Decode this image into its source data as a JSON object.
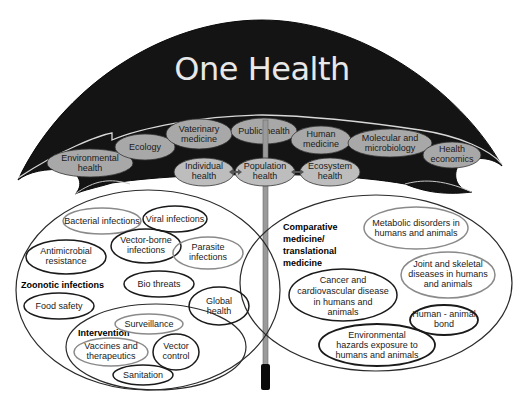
{
  "title": "One Health",
  "canopy": {
    "top_row": [
      {
        "id": "environmental-health",
        "lines": [
          "Environmental",
          "health"
        ]
      },
      {
        "id": "ecology",
        "lines": [
          "Ecology"
        ]
      },
      {
        "id": "veterinary-medicine",
        "lines": [
          "Vaterinary",
          "medicine"
        ]
      },
      {
        "id": "public-health",
        "lines": [
          "Public health"
        ]
      },
      {
        "id": "human-medicine",
        "lines": [
          "Human",
          "medicine"
        ]
      },
      {
        "id": "molecular-microbiology",
        "lines": [
          "Molecular and",
          "microbiology"
        ]
      },
      {
        "id": "health-economics",
        "lines": [
          "Health",
          "economics"
        ]
      }
    ],
    "bottom_row": [
      {
        "id": "individual-health",
        "lines": [
          "Individual",
          "health"
        ]
      },
      {
        "id": "population-health",
        "lines": [
          "Population",
          "health"
        ]
      },
      {
        "id": "ecosystem-health",
        "lines": [
          "Ecosystem",
          "health"
        ]
      }
    ],
    "connectors": "double-headed arrows"
  },
  "left_circle": {
    "label": "Zoonotic infections",
    "items": [
      {
        "id": "bacterial-infections",
        "lines": [
          "Bacterial infections"
        ],
        "border": "#8a8a8a"
      },
      {
        "id": "viral-infections",
        "lines": [
          "Viral infections"
        ],
        "border": "#1a1a1a"
      },
      {
        "id": "vector-borne-infections",
        "lines": [
          "Vector-borne",
          "infections"
        ],
        "border": "#1a1a1a"
      },
      {
        "id": "parasite-infections",
        "lines": [
          "Parasite",
          "infections"
        ],
        "border": "#8a8a8a"
      },
      {
        "id": "antimicrobial-resistance",
        "lines": [
          "Antimicrobial",
          "resistance"
        ],
        "border": "#1a1a1a"
      },
      {
        "id": "bio-threats",
        "lines": [
          "Bio threats"
        ],
        "border": "#1a1a1a"
      },
      {
        "id": "food-safety",
        "lines": [
          "Food safety"
        ],
        "border": "#1a1a1a"
      },
      {
        "id": "global-health",
        "lines": [
          "Global",
          "health"
        ],
        "border": "#1a1a1a"
      }
    ],
    "intervention": {
      "label": "Intervention",
      "items": [
        {
          "id": "surveillance",
          "lines": [
            "Surveillance"
          ],
          "border": "#8a8a8a"
        },
        {
          "id": "vaccines-therapeutics",
          "lines": [
            "Vaccines and",
            "therapeutics"
          ],
          "border": "#8a8a8a"
        },
        {
          "id": "vector-control",
          "lines": [
            "Vector",
            "control"
          ],
          "border": "#1a1a1a"
        },
        {
          "id": "sanitation",
          "lines": [
            "Sanitation"
          ],
          "border": "#1a1a1a"
        }
      ]
    }
  },
  "right_circle": {
    "label_lines": [
      "Comparative",
      "medicine/",
      "translational",
      "medicine"
    ],
    "items": [
      {
        "id": "metabolic-disorders",
        "lines": [
          "Metabolic disorders in",
          "humans and animals"
        ],
        "border": "#8a8a8a"
      },
      {
        "id": "joint-skeletal",
        "lines": [
          "Joint and skeletal",
          "diseases in humans",
          "and animals"
        ],
        "border": "#8a8a8a"
      },
      {
        "id": "cancer-cardiovascular",
        "lines": [
          "Cancer and",
          "cardiovascular disease",
          "in humans and",
          "animals"
        ],
        "border": "#1a1a1a"
      },
      {
        "id": "human-animal-bond",
        "lines": [
          "Human - animal",
          "bond"
        ],
        "border": "#1a1a1a"
      },
      {
        "id": "environmental-hazards",
        "lines": [
          "Environmental",
          "hazards exposure to",
          "humans and animals"
        ],
        "border": "#1a1a1a"
      }
    ]
  },
  "colors": {
    "canopy": "#141414",
    "canopy_oval_fill": "#a8a8a8",
    "title": "#e8e8e8",
    "shaft": "#9a9a9a",
    "handle": "#0a0a0a"
  }
}
